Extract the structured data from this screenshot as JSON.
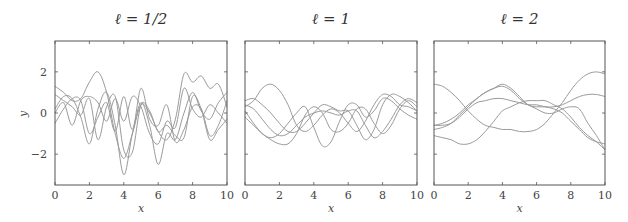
{
  "chart_data": [
    {
      "type": "line",
      "title": "ℓ = 1/2",
      "xlabel": "x",
      "ylabel": "y",
      "xlim": [
        0,
        10
      ],
      "ylim": [
        -3.5,
        3.5
      ],
      "xticks": [
        0,
        2,
        4,
        6,
        8,
        10
      ],
      "yticks": [
        -2,
        0,
        2
      ],
      "grid": false,
      "x": [
        0,
        0.5,
        1,
        1.5,
        2,
        2.5,
        3,
        3.5,
        4,
        4.5,
        5,
        5.5,
        6,
        6.5,
        7,
        7.5,
        8,
        8.5,
        9,
        9.5,
        10
      ],
      "series": [
        {
          "name": "sample 1",
          "values": [
            1.3,
            1.0,
            0.6,
            0.7,
            1.5,
            2.0,
            1.0,
            -1.0,
            -2.2,
            -1.0,
            0.4,
            0.0,
            -0.9,
            -1.3,
            -0.3,
            1.9,
            1.5,
            1.8,
            1.2,
            1.4,
            0.3
          ]
        },
        {
          "name": "sample 2",
          "values": [
            0.2,
            0.8,
            0.7,
            -0.2,
            -1.5,
            0.2,
            1.0,
            -0.6,
            -3.0,
            -1.0,
            0.5,
            -0.6,
            -2.5,
            -1.0,
            -1.3,
            0.0,
            1.0,
            0.1,
            -0.3,
            0.5,
            1.0
          ]
        },
        {
          "name": "sample 3",
          "values": [
            0.9,
            0.6,
            0.3,
            -0.1,
            0.7,
            -1.3,
            0.3,
            0.8,
            -1.8,
            -1.9,
            0.4,
            0.1,
            -0.9,
            -0.6,
            -1.1,
            -1.2,
            0.8,
            0.2,
            -1.3,
            -0.8,
            -0.3
          ]
        },
        {
          "name": "sample 4",
          "values": [
            -0.5,
            0.2,
            0.7,
            0.6,
            -1.0,
            -0.2,
            0.5,
            -0.9,
            0.8,
            -0.8,
            1.2,
            -0.3,
            -0.6,
            0.4,
            -1.4,
            -0.8,
            0.3,
            0.2,
            -1.1,
            -0.6,
            0.6
          ]
        },
        {
          "name": "sample 5",
          "values": [
            0.0,
            0.5,
            -0.6,
            0.6,
            0.8,
            0.5,
            -0.4,
            0.7,
            -0.4,
            0.8,
            0.3,
            -1.0,
            -1.5,
            -0.4,
            -0.7,
            1.2,
            0.2,
            -0.2,
            0.4,
            0.0,
            -0.5
          ]
        }
      ]
    },
    {
      "type": "line",
      "title": "ℓ = 1",
      "xlabel": "x",
      "ylabel": "",
      "xlim": [
        0,
        10
      ],
      "ylim": [
        -3.5,
        3.5
      ],
      "xticks": [
        0,
        2,
        4,
        6,
        8,
        10
      ],
      "yticks": [
        -2,
        0,
        2
      ],
      "grid": false,
      "x": [
        0,
        0.5,
        1,
        1.5,
        2,
        2.5,
        3,
        3.5,
        4,
        4.5,
        5,
        5.5,
        6,
        6.5,
        7,
        7.5,
        8,
        8.5,
        9,
        9.5,
        10
      ],
      "series": [
        {
          "name": "sample 1",
          "values": [
            0.3,
            0.6,
            1.2,
            1.4,
            1.1,
            0.4,
            -0.6,
            -0.9,
            -0.6,
            -0.1,
            0.2,
            0.0,
            -0.5,
            -0.9,
            -0.4,
            0.4,
            0.9,
            0.8,
            0.4,
            0.3,
            0.1
          ]
        },
        {
          "name": "sample 2",
          "values": [
            0.6,
            0.7,
            0.4,
            0.0,
            -0.5,
            -0.9,
            -0.9,
            -0.5,
            0.0,
            0.4,
            0.3,
            0.1,
            0.1,
            -0.6,
            -1.3,
            -0.8,
            0.4,
            0.9,
            0.8,
            0.5,
            0.1
          ]
        },
        {
          "name": "sample 3",
          "values": [
            0.4,
            0.2,
            -0.3,
            -0.8,
            -1.1,
            -1.0,
            -0.6,
            -0.2,
            0.0,
            0.1,
            0.0,
            -0.1,
            0.1,
            0.1,
            -0.6,
            -1.2,
            -0.9,
            -0.3,
            0.4,
            0.7,
            0.5
          ]
        },
        {
          "name": "sample 4",
          "values": [
            -0.2,
            -0.6,
            -1.0,
            -1.3,
            -1.5,
            -1.5,
            -1.0,
            -0.1,
            0.3,
            0.0,
            -0.8,
            -0.9,
            -0.5,
            0.2,
            0.2,
            -0.5,
            -1.0,
            -0.6,
            0.2,
            0.6,
            0.3
          ]
        },
        {
          "name": "sample 5",
          "values": [
            0.1,
            -0.5,
            -1.0,
            -1.2,
            -1.0,
            -0.5,
            0.0,
            0.3,
            -0.7,
            -1.6,
            -1.4,
            -0.4,
            0.4,
            0.4,
            -0.2,
            0.1,
            0.7,
            0.6,
            0.2,
            -0.1,
            -0.3
          ]
        }
      ]
    },
    {
      "type": "line",
      "title": "ℓ = 2",
      "xlabel": "x",
      "ylabel": "",
      "xlim": [
        0,
        10
      ],
      "ylim": [
        -3.5,
        3.5
      ],
      "xticks": [
        0,
        2,
        4,
        6,
        8,
        10
      ],
      "yticks": [
        -2,
        0,
        2
      ],
      "grid": false,
      "x": [
        0,
        0.5,
        1,
        1.5,
        2,
        2.5,
        3,
        3.5,
        4,
        4.5,
        5,
        5.5,
        6,
        6.5,
        7,
        7.5,
        8,
        8.5,
        9,
        9.5,
        10
      ],
      "series": [
        {
          "name": "sample 1",
          "values": [
            1.4,
            1.3,
            1.0,
            0.6,
            0.1,
            -0.3,
            -0.6,
            -0.7,
            -0.8,
            -0.8,
            -0.9,
            -0.9,
            -0.8,
            -0.5,
            0.0,
            0.5,
            1.1,
            1.6,
            1.9,
            2.0,
            1.9
          ]
        },
        {
          "name": "sample 2",
          "values": [
            -0.6,
            -0.5,
            -0.3,
            0.0,
            0.4,
            0.7,
            1.0,
            1.2,
            1.4,
            1.2,
            0.8,
            0.4,
            0.3,
            0.3,
            0.2,
            0.0,
            -0.4,
            -0.8,
            -1.2,
            -1.4,
            -1.5
          ]
        },
        {
          "name": "sample 3",
          "values": [
            -0.8,
            -0.7,
            -0.5,
            -0.1,
            0.3,
            0.7,
            1.0,
            1.2,
            1.3,
            1.1,
            0.7,
            0.4,
            0.2,
            0.0,
            0.0,
            0.2,
            0.3,
            0.2,
            -0.5,
            -1.1,
            -1.8
          ]
        },
        {
          "name": "sample 4",
          "values": [
            -1.1,
            -1.2,
            -1.3,
            -1.5,
            -1.5,
            -1.3,
            -0.9,
            -0.4,
            0.1,
            0.3,
            0.5,
            0.6,
            0.6,
            0.6,
            0.4,
            0.2,
            -0.2,
            -0.7,
            -1.1,
            -1.4,
            -1.8
          ]
        },
        {
          "name": "sample 5",
          "values": [
            -0.6,
            -0.6,
            -0.5,
            -0.2,
            0.2,
            0.5,
            0.6,
            0.7,
            0.7,
            0.6,
            0.5,
            0.4,
            0.4,
            0.3,
            0.3,
            0.4,
            0.6,
            0.8,
            0.9,
            0.9,
            0.8
          ]
        }
      ]
    }
  ],
  "panels": [
    {
      "title": "ℓ = 1/2",
      "xlabel": "x",
      "ylabel": "y"
    },
    {
      "title": "ℓ = 1",
      "xlabel": "x",
      "ylabel": ""
    },
    {
      "title": "ℓ = 2",
      "xlabel": "x",
      "ylabel": ""
    }
  ],
  "colors": {
    "curve": "#9a9a9a",
    "frame": "#555555",
    "text": "#333333"
  }
}
